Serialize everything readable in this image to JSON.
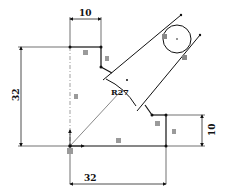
{
  "drawing": {
    "type": "cad-sketch",
    "dimensions": {
      "top_width": "10",
      "left_height": "32",
      "bottom_width": "32",
      "right_height": "10",
      "arc_radius": "R27"
    },
    "constraint_glyph": "=",
    "colors": {
      "line": "#111111",
      "dim": "#222222",
      "centerline": "#777777",
      "constraint_bg": "#9a9a9a",
      "background": "#ffffff"
    }
  }
}
